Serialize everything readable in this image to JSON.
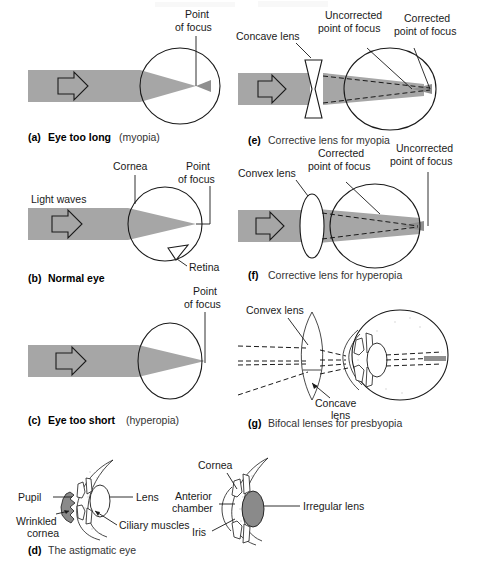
{
  "figure": {
    "background_color": "#ffffff",
    "beam_color": "#a6a6a6",
    "line_color": "#1a1a1a",
    "width": 477,
    "height": 579
  },
  "panels": [
    {
      "id": "a",
      "letter": "(a)",
      "caption_bold": "Eye too long",
      "caption_plain": "(myopia)",
      "labels": [
        {
          "name": "point-of-focus",
          "line1": "Point",
          "line2": "of focus"
        }
      ]
    },
    {
      "id": "b",
      "letter": "(b)",
      "caption_bold": "Normal eye",
      "caption_plain": "",
      "labels": [
        {
          "name": "light-waves",
          "line1": "Light waves",
          "line2": ""
        },
        {
          "name": "cornea",
          "line1": "Cornea",
          "line2": ""
        },
        {
          "name": "point-of-focus",
          "line1": "Point",
          "line2": "of focus"
        },
        {
          "name": "retina",
          "line1": "Retina",
          "line2": ""
        }
      ]
    },
    {
      "id": "c",
      "letter": "(c)",
      "caption_bold": "Eye too short",
      "caption_plain": "(hyperopia)",
      "labels": [
        {
          "name": "point-of-focus",
          "line1": "Point",
          "line2": "of focus"
        }
      ]
    },
    {
      "id": "d",
      "letter": "(d)",
      "caption_bold": "",
      "caption_plain": "The astigmatic eye",
      "labels": [
        {
          "name": "pupil",
          "line1": "Pupil",
          "line2": ""
        },
        {
          "name": "lens",
          "line1": "Lens",
          "line2": ""
        },
        {
          "name": "wrinkled-cornea",
          "line1": "Wrinkled",
          "line2": "cornea"
        },
        {
          "name": "ciliary-muscles",
          "line1": "Ciliary muscles",
          "line2": ""
        },
        {
          "name": "cornea",
          "line1": "Cornea",
          "line2": ""
        },
        {
          "name": "anterior-chamber",
          "line1": "Anterior",
          "line2": "chamber"
        },
        {
          "name": "iris",
          "line1": "Iris",
          "line2": ""
        },
        {
          "name": "irregular-lens",
          "line1": "Irregular lens",
          "line2": ""
        }
      ]
    },
    {
      "id": "e",
      "letter": "(e)",
      "caption_bold": "",
      "caption_plain": "Corrective lens for myopia",
      "labels": [
        {
          "name": "concave-lens",
          "line1": "Concave lens",
          "line2": ""
        },
        {
          "name": "uncorrected-point-of-focus",
          "line1": "Uncorrected",
          "line2": "point of focus"
        },
        {
          "name": "corrected-point-of-focus",
          "line1": "Corrected",
          "line2": "point of focus"
        }
      ]
    },
    {
      "id": "f",
      "letter": "(f)",
      "caption_bold": "",
      "caption_plain": "Corrective lens for hyperopia",
      "labels": [
        {
          "name": "convex-lens",
          "line1": "Convex lens",
          "line2": ""
        },
        {
          "name": "corrected-point-of-focus",
          "line1": "Corrected",
          "line2": "point of focus"
        },
        {
          "name": "uncorrected-point-of-focus",
          "line1": "Uncorrected",
          "line2": "point of focus"
        }
      ]
    },
    {
      "id": "g",
      "letter": "(g)",
      "caption_bold": "",
      "caption_plain": "Bifocal lenses for presbyopia",
      "labels": [
        {
          "name": "convex-lens",
          "line1": "Convex lens",
          "line2": ""
        },
        {
          "name": "concave-lens",
          "line1": "Concave",
          "line2": "lens"
        }
      ]
    }
  ],
  "text": {
    "a_letter": "(a)",
    "a_bold": "Eye too long",
    "a_plain": "(myopia)",
    "a_point": "Point",
    "a_focus": "of focus",
    "b_letter": "(b)",
    "b_bold": "Normal eye",
    "b_lightwaves": "Light waves",
    "b_cornea": "Cornea",
    "b_point": "Point",
    "b_focus": "of focus",
    "b_retina": "Retina",
    "c_letter": "(c)",
    "c_bold": "Eye too short",
    "c_plain": "(hyperopia)",
    "c_point": "Point",
    "c_focus": "of focus",
    "d_letter": "(d)",
    "d_plain": "The astigmatic eye",
    "d_pupil": "Pupil",
    "d_lens": "Lens",
    "d_wrinkled": "Wrinkled",
    "d_cornea2": "cornea",
    "d_ciliary": "Ciliary muscles",
    "d_cornea": "Cornea",
    "d_anterior": "Anterior",
    "d_chamber": "chamber",
    "d_iris": "Iris",
    "d_irregular": "Irregular lens",
    "e_letter": "(e)",
    "e_plain": "Corrective lens for myopia",
    "e_concave": "Concave lens",
    "e_unc1": "Uncorrected",
    "e_unc2": "point of focus",
    "e_cor1": "Corrected",
    "e_cor2": "point of focus",
    "f_letter": "(f)",
    "f_plain": "Corrective lens for hyperopia",
    "f_convex": "Convex lens",
    "f_cor1": "Corrected",
    "f_cor2": "point of focus",
    "f_unc1": "Uncorrected",
    "f_unc2": "point of focus",
    "g_letter": "(g)",
    "g_plain": "Bifocal lenses for presbyopia",
    "g_convex": "Convex lens",
    "g_concave1": "Concave",
    "g_concave2": "lens"
  }
}
